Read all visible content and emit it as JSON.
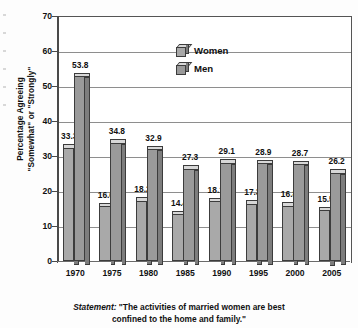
{
  "chart_data": {
    "type": "bar",
    "title": "",
    "subtitle": "",
    "xlabel": "",
    "ylabel": "Percentage Agreeing \"Somewhat\" or \"Strongly\"",
    "ylabel_line1": "Percentage Agreeing",
    "ylabel_line2": "\"Somewhat\" or \"Strongly\"",
    "categories": [
      "1970",
      "1975",
      "1980",
      "1985",
      "1990",
      "1995",
      "2000",
      "2005"
    ],
    "series": [
      {
        "name": "Women",
        "color": "#a9a9a9",
        "values": [
          33.3,
          16.6,
          18.2,
          14.4,
          18.1,
          17.3,
          16.8,
          15.5
        ],
        "labels": [
          "33.3",
          "16.6",
          "18.2",
          "14.4",
          "18.1",
          "17.3",
          "16.8",
          "15.5"
        ]
      },
      {
        "name": "Men",
        "color": "#9a9a9a",
        "values": [
          53.8,
          34.8,
          32.9,
          27.3,
          29.1,
          28.9,
          28.7,
          26.2
        ],
        "labels": [
          "53.8",
          "34.8",
          "32.9",
          "27.3",
          "29.1",
          "28.9",
          "28.7",
          "26.2"
        ]
      }
    ],
    "ylim": [
      0,
      70
    ],
    "yticks": [
      0,
      10,
      20,
      30,
      40,
      50,
      60,
      70
    ],
    "ytick_labels": [
      "0",
      "10",
      "20",
      "30",
      "40",
      "50",
      "60",
      "70"
    ],
    "grid": true,
    "grid_axis": "y",
    "legend_position": "inside-top-center",
    "legend_entries": [
      "Women",
      "Men"
    ]
  },
  "legend": {
    "women_label": "Women",
    "men_label": "Men"
  },
  "caption": {
    "prefix": "Statement:",
    "line1": " \"The activities of married women are best",
    "line2": "confined to the home and family.\""
  },
  "colors": {
    "bar_women": "#a9a9a9",
    "bar_men": "#9a9a9a",
    "bar_top": "#d8d8d8",
    "bar_side": "#7d7d7d",
    "bar_outline": "#3c3c3c",
    "gridline": "#8e8e8e",
    "axis": "#4a4a4a",
    "text": "#111111",
    "background": "#ffffff"
  }
}
